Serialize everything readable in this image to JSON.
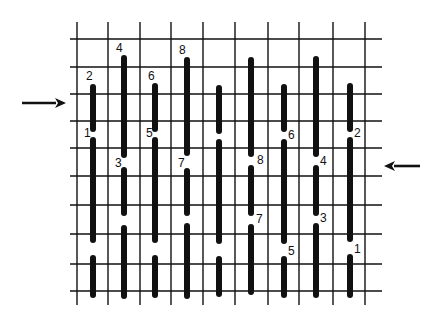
{
  "diagram": {
    "type": "needlepoint-stitch-chart",
    "colors": {
      "background": "#ffffff",
      "ink": "#111111"
    },
    "grid": {
      "vertical_lines_x": [
        77,
        108,
        140,
        171,
        203,
        235,
        268,
        299,
        333,
        365
      ],
      "vertical_extent": [
        22,
        305
      ],
      "horizontal_lines_y": [
        39,
        67,
        94,
        121,
        148,
        176,
        205,
        234,
        264,
        291
      ],
      "horizontal_extent": [
        70,
        382
      ]
    },
    "stitches": [
      {
        "x": 93,
        "y1": 87,
        "y2": 129,
        "label": "2",
        "lx": 86,
        "ly": 80
      },
      {
        "x": 93,
        "y1": 140,
        "y2": 240,
        "label": "1",
        "lx": 84,
        "ly": 137
      },
      {
        "x": 93,
        "y1": 258,
        "y2": 295,
        "label": "",
        "lx": 0,
        "ly": 0
      },
      {
        "x": 124,
        "y1": 58,
        "y2": 155,
        "label": "4",
        "lx": 116,
        "ly": 52
      },
      {
        "x": 124,
        "y1": 170,
        "y2": 213,
        "label": "3",
        "lx": 115,
        "ly": 167
      },
      {
        "x": 124,
        "y1": 228,
        "y2": 296,
        "label": "",
        "lx": 0,
        "ly": 0
      },
      {
        "x": 155,
        "y1": 86,
        "y2": 129,
        "label": "6",
        "lx": 148,
        "ly": 80
      },
      {
        "x": 155,
        "y1": 140,
        "y2": 240,
        "label": "5",
        "lx": 146,
        "ly": 137
      },
      {
        "x": 155,
        "y1": 258,
        "y2": 295,
        "label": "",
        "lx": 0,
        "ly": 0
      },
      {
        "x": 187,
        "y1": 60,
        "y2": 153,
        "label": "8",
        "lx": 179,
        "ly": 54
      },
      {
        "x": 187,
        "y1": 171,
        "y2": 213,
        "label": "7",
        "lx": 178,
        "ly": 167
      },
      {
        "x": 187,
        "y1": 226,
        "y2": 296,
        "label": "",
        "lx": 0,
        "ly": 0
      },
      {
        "x": 219,
        "y1": 88,
        "y2": 131,
        "label": "",
        "lx": 0,
        "ly": 0
      },
      {
        "x": 219,
        "y1": 142,
        "y2": 241,
        "label": "",
        "lx": 0,
        "ly": 0
      },
      {
        "x": 219,
        "y1": 259,
        "y2": 294,
        "label": "",
        "lx": 0,
        "ly": 0
      },
      {
        "x": 251,
        "y1": 60,
        "y2": 154,
        "label": "",
        "lx": 0,
        "ly": 0
      },
      {
        "x": 251,
        "y1": 168,
        "y2": 213,
        "label": "8",
        "lx": 257,
        "ly": 164
      },
      {
        "x": 251,
        "y1": 227,
        "y2": 292,
        "label": "7",
        "lx": 256,
        "ly": 223
      },
      {
        "x": 284,
        "y1": 87,
        "y2": 129,
        "label": "",
        "lx": 0,
        "ly": 0
      },
      {
        "x": 284,
        "y1": 142,
        "y2": 241,
        "label": "6",
        "lx": 288,
        "ly": 139
      },
      {
        "x": 284,
        "y1": 259,
        "y2": 295,
        "label": "5",
        "lx": 288,
        "ly": 255
      },
      {
        "x": 316,
        "y1": 59,
        "y2": 154,
        "label": "",
        "lx": 0,
        "ly": 0
      },
      {
        "x": 316,
        "y1": 168,
        "y2": 213,
        "label": "4",
        "lx": 320,
        "ly": 165
      },
      {
        "x": 316,
        "y1": 226,
        "y2": 295,
        "label": "3",
        "lx": 320,
        "ly": 222
      },
      {
        "x": 350,
        "y1": 86,
        "y2": 129,
        "label": "",
        "lx": 0,
        "ly": 0
      },
      {
        "x": 350,
        "y1": 140,
        "y2": 239,
        "label": "2",
        "lx": 354,
        "ly": 137
      },
      {
        "x": 350,
        "y1": 257,
        "y2": 295,
        "label": "1",
        "lx": 354,
        "ly": 253
      }
    ],
    "arrows": [
      {
        "name": "left-arrow-pointing-right",
        "x1": 22,
        "y1": 103,
        "x2": 66,
        "y2": 103,
        "direction": "right"
      },
      {
        "name": "right-arrow-pointing-left",
        "x1": 420,
        "y1": 166,
        "x2": 384,
        "y2": 166,
        "direction": "left"
      }
    ]
  }
}
